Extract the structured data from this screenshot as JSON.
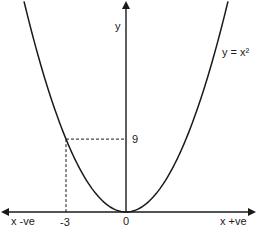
{
  "chart_data": {
    "type": "line",
    "title": "",
    "function": "y = x^2",
    "series": [
      {
        "name": "y = x²",
        "x": [
          -5.1,
          -4,
          -3,
          -2,
          -1,
          0,
          1,
          2,
          3,
          4,
          5.1
        ],
        "y": [
          26.01,
          16,
          9,
          4,
          1,
          0,
          1,
          4,
          9,
          16,
          26.01
        ]
      }
    ],
    "annotation": {
      "point": {
        "x": -3,
        "y": 9
      },
      "style": "dashed guide lines to axes"
    },
    "xlim": [
      -6.2,
      6.5
    ],
    "ylim": [
      0,
      26
    ],
    "labels": {
      "y_axis": "y",
      "curve": "y = x²",
      "x_neg": "x -ve",
      "x_pos": "x +ve",
      "origin": "0",
      "x_tick": "-3",
      "y_tick": "9"
    },
    "grid": false
  }
}
